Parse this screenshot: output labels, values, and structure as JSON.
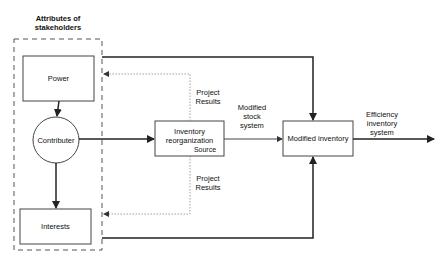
{
  "diagram": {
    "group": {
      "title": "Attributes of\nstakeholders"
    },
    "nodes": {
      "power": {
        "label": "Power"
      },
      "contributer": {
        "label": "Contributer"
      },
      "interests": {
        "label": "Interests"
      },
      "inventory_reorg": {
        "label": "Inventory\nreorganization",
        "sublabel": "Source"
      },
      "modified_inventory": {
        "label": "Modified inventory"
      }
    },
    "edge_labels": {
      "project_results_top": "Project\nResults",
      "project_results_bottom": "Project\nResults",
      "modified_stock_system": "Modified\nstock\nsystem",
      "efficiency_inventory_system": "Efficiency\ninventory\nsystem"
    },
    "colors": {
      "stroke": "#222222",
      "dashed": "#555555",
      "dotted": "#888888",
      "background": "#ffffff"
    }
  }
}
